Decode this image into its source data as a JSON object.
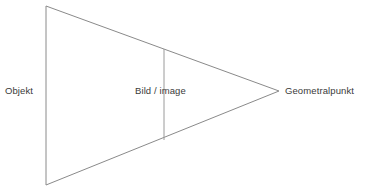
{
  "diagram": {
    "background_color": "#ffffff",
    "stroke_color": "#8a8a8a",
    "text_color": "#3a3a3a",
    "labels": {
      "object": "Objekt",
      "image_plane": "Bild / image",
      "vanishing_point": "Geometralpunkt"
    },
    "geometry": {
      "object_line": {
        "x1": 46,
        "y1": 6,
        "x2": 46,
        "y2": 185
      },
      "upper_ray": {
        "x1": 46,
        "y1": 6,
        "x2": 279,
        "y2": 91
      },
      "lower_ray": {
        "x1": 46,
        "y1": 185,
        "x2": 279,
        "y2": 91
      },
      "image_line": {
        "x1": 164,
        "y1": 49,
        "x2": 164,
        "y2": 140
      },
      "apex": {
        "x": 279,
        "y": 91
      }
    }
  }
}
